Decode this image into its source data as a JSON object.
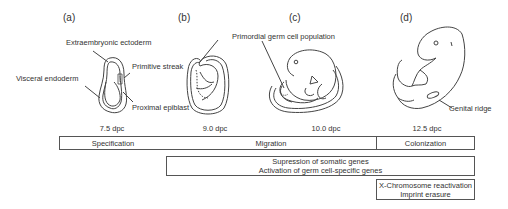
{
  "panels": [
    {
      "id": "a",
      "label": "(a)",
      "stage": "7.5 dpc",
      "annotations": [
        "Extraembryonic ectoderm",
        "Primitive streak",
        "Visceral endoderm",
        "Proximal epiblast"
      ]
    },
    {
      "id": "b",
      "label": "(b)",
      "stage": "9.0 dpc",
      "annotations": [
        "Primordial germ cell population"
      ]
    },
    {
      "id": "c",
      "label": "(c)",
      "stage": "10.0 dpc",
      "annotations": []
    },
    {
      "id": "d",
      "label": "(d)",
      "stage": "12.5 dpc",
      "annotations": [
        "Genital ridge"
      ]
    }
  ],
  "timeline": {
    "phases": [
      "Specification",
      "Migration",
      "Colonization"
    ],
    "events": [
      {
        "lines": [
          "Supression of somatic genes",
          "Activation of germ cell-specific genes"
        ]
      },
      {
        "lines": [
          "X-Chromosome reactivation",
          "Imprint erasure"
        ]
      }
    ]
  },
  "colors": {
    "line": "#444444",
    "box_border": "#555555",
    "text": "#333333"
  }
}
